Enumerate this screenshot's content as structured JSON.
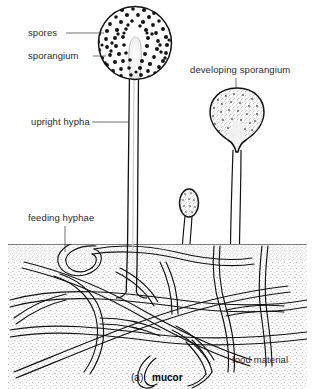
{
  "figure": {
    "title": "mucor",
    "caption_prefix": "(a)",
    "caption_name": "mucor",
    "organism": "Mucor",
    "diagram_type": "biological line drawing",
    "colors": {
      "ink": "#111111",
      "label_text": "#2b2b2b",
      "leader_line": "#333333",
      "substrate_stipple": "#8a8a8a",
      "spore_fill": "#1a1a1a",
      "background": "#ffffff"
    }
  },
  "labels": {
    "spores": "spores",
    "sporangium": "sporangium",
    "upright_hypha": "upright hypha",
    "developing_sporangium": "developing sporangium",
    "feeding_hyphae": "feeding hyphae",
    "food_material": "food material"
  },
  "structures": [
    {
      "name": "mature-sporangium",
      "label": "sporangium",
      "description": "large round spore case densely packed with dark spores",
      "shape": "circle",
      "center": [
        135,
        43
      ],
      "radius": 37
    },
    {
      "name": "spores",
      "label": "spores",
      "description": "dark dots filling the mature sporangium",
      "count": 210
    },
    {
      "name": "columella",
      "label": "columella",
      "description": "pale club-shaped swelling of the hypha tip inside the sporangium"
    },
    {
      "name": "upright-hypha",
      "label": "upright hypha",
      "description": "tall vertical stalk bearing the mature sporangium",
      "top": 75,
      "bottom": 292
    },
    {
      "name": "developing-sporangium",
      "label": "developing sporangium",
      "description": "pear-shaped immature spore case on a short stalk at right",
      "center": [
        237,
        115
      ]
    },
    {
      "name": "young-sporangium",
      "label": "young sporangium",
      "description": "small oval immature spore case in the middle",
      "center": [
        189,
        204
      ]
    },
    {
      "name": "feeding-hyphae",
      "label": "feeding hyphae",
      "description": "branching network of tubular threads spreading through the food"
    },
    {
      "name": "food-material",
      "label": "food material",
      "description": "stippled substrate block in which the feeding hyphae grow",
      "surface_y": 244
    }
  ]
}
